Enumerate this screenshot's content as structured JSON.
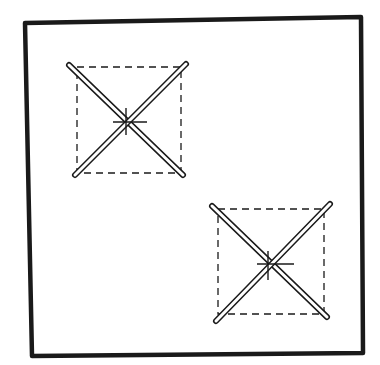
{
  "diagram": {
    "title": "",
    "background": "#ffffff",
    "ink": "#1a1a1a",
    "frame": {
      "points": [
        [
          25,
          23
        ],
        [
          361,
          17
        ],
        [
          363,
          353
        ],
        [
          32,
          356
        ]
      ],
      "stroke_width": 4.5
    },
    "symbols": [
      {
        "id": "symbol-top-left",
        "dashed_box": {
          "x1": 77,
          "y1": 67,
          "x2": 181,
          "y2": 173
        },
        "bars": [
          {
            "from": [
              69,
              65
            ],
            "to": [
              183,
              175
            ]
          },
          {
            "from": [
              186,
              64
            ],
            "to": [
              75,
              175
            ]
          }
        ],
        "crosshair": {
          "cx": 126,
          "cy": 122,
          "h_from": 113,
          "h_to": 147,
          "v_from": 108,
          "v_to": 135
        }
      },
      {
        "id": "symbol-bottom-right",
        "dashed_box": {
          "x1": 218,
          "y1": 209,
          "x2": 324,
          "y2": 314
        },
        "bars": [
          {
            "from": [
              212,
              206
            ],
            "to": [
              327,
              317
            ]
          },
          {
            "from": [
              330,
              204
            ],
            "to": [
              216,
              321
            ]
          }
        ],
        "crosshair": {
          "cx": 268,
          "cy": 264,
          "h_from": 257,
          "h_to": 294,
          "v_from": 251,
          "v_to": 280
        }
      }
    ],
    "bar_style": {
      "outer_width": 6,
      "inner_width": 3,
      "dash_pattern": "7 5"
    }
  }
}
